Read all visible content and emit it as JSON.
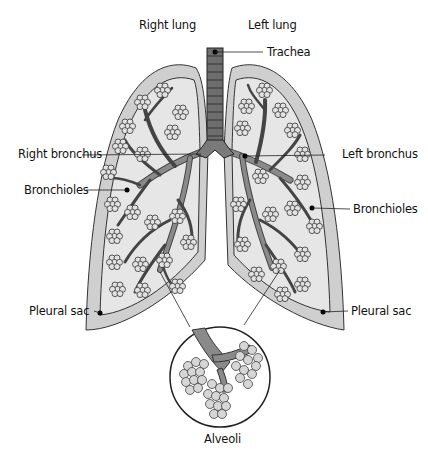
{
  "diagram": {
    "title_labels": {
      "right_lung": "Right lung",
      "left_lung": "Left lung"
    },
    "labels": {
      "trachea": "Trachea",
      "right_bronchus": "Right bronchus",
      "left_bronchus": "Left bronchus",
      "bronchioles_right": "Bronchioles",
      "bronchioles_left": "Bronchioles",
      "pleural_sac_right": "Pleural sac",
      "pleural_sac_left": "Pleural sac",
      "alveoli": "Alveoli"
    },
    "colors": {
      "pleura_fill": "#cfcfcf",
      "lung_fill": "#e6e6e6",
      "airway_fill": "#7a7a7a",
      "trachea_fill": "#6e6e6e",
      "alveoli_fill": "#d8d8d8",
      "outline": "#222222"
    }
  }
}
